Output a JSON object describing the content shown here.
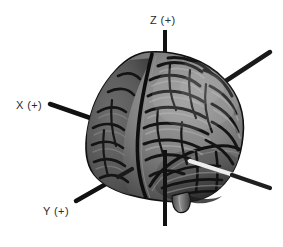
{
  "figure": {
    "kind": "3d-brain-render-with-coordinate-axes",
    "background_color": "#ffffff",
    "width": 283,
    "height": 247,
    "axes": [
      {
        "id": "z-positive",
        "label": "Z (+)",
        "label_text": "Z (+)",
        "direction": "up",
        "color": "#111111"
      },
      {
        "id": "x-positive",
        "label": "X (+)",
        "label_text": "X (+)",
        "direction": "left-and-slightly-down",
        "color": "#111111"
      },
      {
        "id": "y-positive",
        "label": "Y (+)",
        "label_text": "Y (+)",
        "direction": "lower-left",
        "color": "#111111"
      }
    ],
    "unlabeled_axes": [
      {
        "id": "y-negative",
        "direction": "upper-right",
        "color": "#1a1a1a"
      },
      {
        "id": "x-negative",
        "direction": "lower-right",
        "color": "#1f1f1f"
      }
    ],
    "colors": {
      "axis_dark": "#111111",
      "axis_light": "#e8e8e8",
      "brain_mid": "#7a7a7a",
      "brain_light": "#a8a8a8",
      "brain_dark": "#3a3a3a",
      "sulcus": "#161616",
      "label": "#2b2b2b",
      "background": "#ffffff"
    }
  }
}
